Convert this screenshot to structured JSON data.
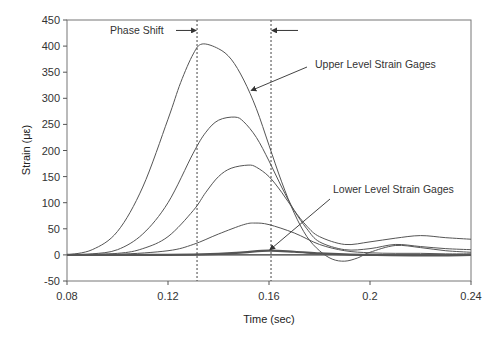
{
  "chart_data": {
    "type": "line",
    "title": "",
    "xlabel": "Time (sec)",
    "ylabel": "Strain (με)",
    "xlim": [
      0.08,
      0.24
    ],
    "ylim": [
      -50,
      450
    ],
    "x_ticks": [
      0.08,
      0.12,
      0.16,
      0.2,
      0.24
    ],
    "x_tick_labels": [
      "0.08",
      "0.12",
      "0.16",
      "0.2",
      "0.24"
    ],
    "y_ticks": [
      -50,
      0,
      50,
      100,
      150,
      200,
      250,
      300,
      350,
      400,
      450
    ],
    "y_tick_labels": [
      "-50",
      "0",
      "50",
      "100",
      "150",
      "200",
      "250",
      "300",
      "350",
      "400",
      "450"
    ],
    "grid": false,
    "legend": null,
    "line_color": "#555555",
    "series": [
      {
        "name": "Upper gage 1",
        "x": [
          0.08,
          0.09,
          0.1,
          0.11,
          0.12,
          0.125,
          0.13,
          0.1335,
          0.14,
          0.145,
          0.15,
          0.155,
          0.16,
          0.165,
          0.17,
          0.175,
          0.18,
          0.185,
          0.19,
          0.195,
          0.2,
          0.21,
          0.22,
          0.23,
          0.24
        ],
        "y": [
          0,
          10,
          45,
          130,
          260,
          330,
          385,
          404,
          395,
          375,
          335,
          280,
          210,
          140,
          80,
          35,
          8,
          -8,
          -12,
          -6,
          5,
          18,
          14,
          8,
          5
        ]
      },
      {
        "name": "Upper gage 2",
        "x": [
          0.08,
          0.09,
          0.1,
          0.11,
          0.12,
          0.13,
          0.135,
          0.14,
          0.1465,
          0.15,
          0.155,
          0.16,
          0.165,
          0.17,
          0.175,
          0.18,
          0.19,
          0.2,
          0.21,
          0.22,
          0.23,
          0.24
        ],
        "y": [
          0,
          2,
          10,
          40,
          100,
          195,
          235,
          258,
          264,
          255,
          225,
          180,
          130,
          85,
          50,
          25,
          10,
          12,
          20,
          16,
          12,
          10
        ]
      },
      {
        "name": "Upper gage 3",
        "x": [
          0.08,
          0.1,
          0.11,
          0.12,
          0.13,
          0.135,
          0.14,
          0.145,
          0.1517,
          0.155,
          0.16,
          0.165,
          0.17,
          0.175,
          0.18,
          0.19,
          0.2,
          0.21,
          0.22,
          0.23,
          0.24
        ],
        "y": [
          0,
          3,
          12,
          35,
          85,
          120,
          150,
          166,
          172,
          168,
          150,
          120,
          85,
          55,
          35,
          20,
          25,
          32,
          37,
          33,
          30
        ]
      },
      {
        "name": "Upper gage 4",
        "x": [
          0.08,
          0.1,
          0.12,
          0.13,
          0.14,
          0.15,
          0.1545,
          0.16,
          0.17,
          0.18,
          0.19,
          0.2,
          0.21,
          0.22,
          0.23,
          0.24
        ],
        "y": [
          0,
          1,
          8,
          20,
          40,
          58,
          61,
          58,
          42,
          20,
          8,
          4,
          3,
          3,
          2,
          2
        ]
      },
      {
        "name": "Lower gages",
        "x": [
          0.08,
          0.12,
          0.14,
          0.15,
          0.16,
          0.17,
          0.18,
          0.19,
          0.2,
          0.22,
          0.24
        ],
        "y": [
          0,
          0,
          2,
          5,
          8,
          6,
          3,
          1,
          0,
          -1,
          0
        ]
      }
    ],
    "annotations": [
      {
        "text": "Phase Shift",
        "type": "double-arrow",
        "x_start": 0.1315,
        "x_end": 0.1608,
        "y": 430
      },
      {
        "text": "Upper Level Strain Gages",
        "arrow_to": {
          "x": 0.153,
          "y": 315
        }
      },
      {
        "text": "Lower Level Strain Gages",
        "arrow_to": {
          "x": 0.16,
          "y": 8
        }
      },
      {
        "type": "vertical-dashed-line",
        "x": 0.1315
      },
      {
        "type": "vertical-dashed-line",
        "x": 0.1608
      }
    ]
  }
}
